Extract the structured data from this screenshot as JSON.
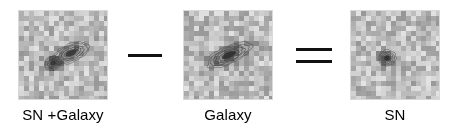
{
  "figure": {
    "background_color": "#ffffff",
    "ink_color": "#000000"
  },
  "panels": [
    {
      "id": "sn-galaxy",
      "label": "SN +Galaxy",
      "alt": "Pixelated grayscale postage stamp with contours around a blended supernova and host galaxy",
      "contour_color": "#3a3a3a",
      "noise_seed": 17,
      "sources": [
        {
          "name": "supernova",
          "cx": 34,
          "cy": 52,
          "rx": 9,
          "ry": 7,
          "angle": -22,
          "levels": 6,
          "peak": 0.97
        },
        {
          "name": "galaxy",
          "cx": 52,
          "cy": 42,
          "rx": 20,
          "ry": 9,
          "angle": -22,
          "levels": 5,
          "peak": 0.8
        }
      ]
    },
    {
      "id": "galaxy",
      "label": "Galaxy",
      "alt": "Pixelated grayscale postage stamp with contours around an elongated host galaxy only",
      "contour_color": "#3a3a3a",
      "noise_seed": 43,
      "sources": [
        {
          "name": "galaxy",
          "cx": 45,
          "cy": 44,
          "rx": 24,
          "ry": 9,
          "angle": -24,
          "levels": 6,
          "peak": 0.9
        }
      ]
    },
    {
      "id": "sn",
      "label": "SN",
      "alt": "Pixelated grayscale postage stamp with a single compact contour marking the supernova residual",
      "contour_color": "#3a3a3a",
      "noise_seed": 91,
      "sources": [
        {
          "name": "supernova",
          "cx": 36,
          "cy": 47,
          "rx": 9,
          "ry": 8,
          "angle": -10,
          "levels": 5,
          "peak": 0.95
        }
      ]
    }
  ],
  "operators": [
    {
      "id": "minus",
      "symbol": "minus",
      "glyph": "—",
      "bars": 1
    },
    {
      "id": "equals",
      "symbol": "equals",
      "glyph": "=",
      "bars": 2
    }
  ],
  "colormap": {
    "name": "grayscale-inverted",
    "low": "#ffffff",
    "high": "#6a6a6a",
    "grid_cells": 18
  }
}
